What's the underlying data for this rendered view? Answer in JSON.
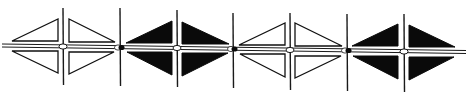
{
  "figure": {
    "colors": {
      "ink": "#0a0a0a",
      "paper": "#ffffff"
    },
    "band": {
      "start": [
        2,
        45.5
      ],
      "end": [
        466,
        52
      ],
      "gap": 3
    },
    "units": [
      {
        "style": "outline",
        "center": [
          63,
          46.5
        ],
        "vline": [
          8,
          85
        ],
        "triangles": [
          [
            [
              12,
              41
            ],
            [
              58,
              41
            ],
            [
              58,
              19
            ]
          ],
          [
            [
              12,
              51
            ],
            [
              58,
              51
            ],
            [
              58,
              73
            ]
          ],
          [
            [
              69,
              19
            ],
            [
              69,
              42
            ],
            [
              115,
              42
            ]
          ],
          [
            [
              69,
              52
            ],
            [
              69,
              74
            ],
            [
              114,
              52
            ]
          ]
        ]
      },
      {
        "style": "filled",
        "center": [
          177,
          48
        ],
        "vline": [
          10,
          87
        ],
        "triangles": [
          [
            [
              126,
              43
            ],
            [
              172,
              43
            ],
            [
              172,
              21
            ]
          ],
          [
            [
              127,
              52
            ],
            [
              172,
              52
            ],
            [
              172,
              75
            ]
          ],
          [
            [
              182,
              22
            ],
            [
              182,
              44
            ],
            [
              229,
              44
            ]
          ],
          [
            [
              182,
              53
            ],
            [
              182,
              76
            ],
            [
              228,
              53
            ]
          ]
        ]
      },
      {
        "style": "outline",
        "center": [
          290,
          50
        ],
        "vline": [
          13,
          90
        ],
        "triangles": [
          [
            [
              239,
              45
            ],
            [
              285,
              45
            ],
            [
              285,
              23
            ]
          ],
          [
            [
              240,
              54
            ],
            [
              285,
              54
            ],
            [
              285,
              77
            ]
          ],
          [
            [
              295,
              23
            ],
            [
              295,
              46
            ],
            [
              342,
              46
            ]
          ],
          [
            [
              295,
              56
            ],
            [
              295,
              78
            ],
            [
              341,
              56
            ]
          ]
        ]
      },
      {
        "style": "filled",
        "center": [
          404,
          51.5
        ],
        "vline": [
          14,
          92
        ],
        "triangles": [
          [
            [
              352,
              46
            ],
            [
              398,
              46
            ],
            [
              398,
              24
            ]
          ],
          [
            [
              353,
              56
            ],
            [
              398,
              56
            ],
            [
              398,
              79
            ]
          ],
          [
            [
              409,
              25
            ],
            [
              409,
              47
            ],
            [
              455,
              47
            ]
          ],
          [
            [
              409,
              57
            ],
            [
              409,
              80
            ],
            [
              454,
              57
            ]
          ]
        ]
      }
    ],
    "separators": [
      {
        "x": 120,
        "y": 47.5,
        "vline": [
          8,
          86
        ]
      },
      {
        "x": 233,
        "y": 49,
        "vline": [
          13,
          88
        ]
      },
      {
        "x": 347,
        "y": 50.5,
        "vline": [
          14,
          91
        ]
      }
    ]
  }
}
